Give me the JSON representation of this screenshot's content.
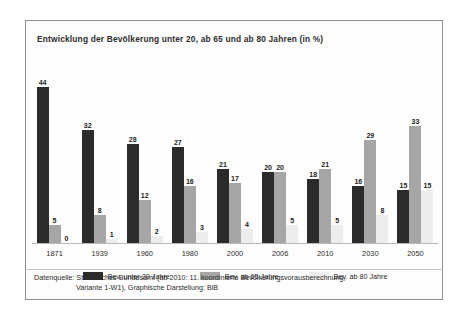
{
  "chart_data": {
    "type": "bar",
    "title": "Entwicklung der Bevölkerung unter 20, ab 65 und ab 80 Jahren (in %)",
    "xlabel": "",
    "ylabel": "",
    "ylim": [
      0,
      46
    ],
    "grid": false,
    "legend_position": "bottom",
    "categories": [
      "1871",
      "1939",
      "1960",
      "1980",
      "2000",
      "2006",
      "2010",
      "2030",
      "2050"
    ],
    "series": [
      {
        "name": "Bev. unter 20 Jahre",
        "color": "#2b2b2b",
        "values": [
          44,
          32,
          28,
          27,
          21,
          20,
          18,
          16,
          15
        ]
      },
      {
        "name": "Bev. ab 65 Jahre",
        "color": "#a6a6a6",
        "values": [
          5,
          8,
          12,
          16,
          17,
          20,
          21,
          29,
          33
        ]
      },
      {
        "name": "Bev. ab 80 Jahre",
        "color": "#ededed",
        "values": [
          0,
          1,
          2,
          3,
          4,
          5,
          5,
          8,
          15
        ]
      }
    ],
    "source_note_line1": "Datenquelle: Statistisches Bundesamt (ab 2010: 11. koordinierte Bevölkerungsvorausberechnung,",
    "source_note_line2": "Variante 1-W1), Graphische Darstellung: BiB"
  }
}
